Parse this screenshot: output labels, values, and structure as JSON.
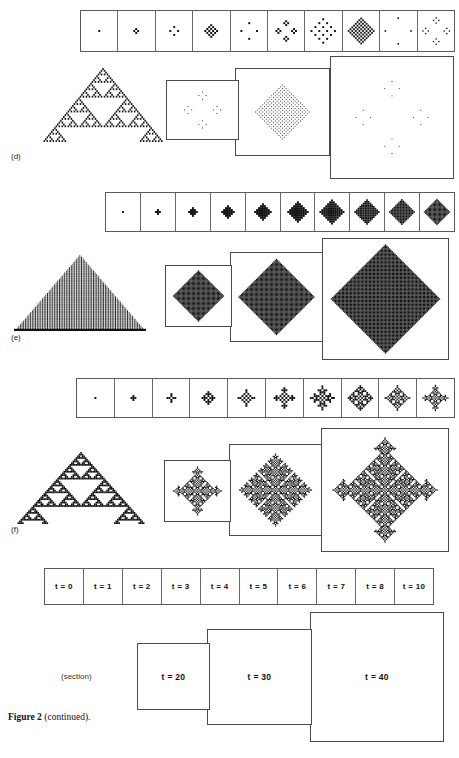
{
  "figure": {
    "caption_bold": "Figure 2",
    "caption_rest": " (continued).",
    "section_word": "(section)"
  },
  "sections": [
    {
      "id": "d",
      "label": "(d)",
      "strip_cells": [
        "t=0",
        "t=1",
        "t=2",
        "t=3",
        "t=4",
        "t=5",
        "t=6",
        "t=7",
        "t=8",
        "t=10"
      ],
      "panels": [
        "t = 20",
        "t = 30",
        "t = 40"
      ],
      "pattern": "sparse-dotted"
    },
    {
      "id": "e",
      "label": "(e)",
      "strip_cells": [
        "t=0",
        "t=1",
        "t=2",
        "t=3",
        "t=4",
        "t=5",
        "t=6",
        "t=7",
        "t=8",
        "t=10"
      ],
      "panels": [
        "t = 20",
        "t = 30",
        "t = 40"
      ],
      "pattern": "solid-diamond"
    },
    {
      "id": "f",
      "label": "(f)",
      "strip_cells": [
        "t=0",
        "t=1",
        "t=2",
        "t=3",
        "t=4",
        "t=5",
        "t=6",
        "t=7",
        "t=8",
        "t=10"
      ],
      "panels": [
        "t = 20",
        "t = 30",
        "t = 40"
      ],
      "pattern": "lace-diamond"
    }
  ],
  "legend": {
    "row_labels": [
      "t = 0",
      "t = 1",
      "t = 2",
      "t = 3",
      "t = 4",
      "t = 5",
      "t = 6",
      "t = 7",
      "t = 8",
      "t = 10"
    ],
    "big_labels": [
      "t = 20",
      "t = 30",
      "t = 40"
    ]
  },
  "colors": {
    "ink": "#111111",
    "rule_line": "#4a4a4a",
    "paper": "#ffffff"
  }
}
